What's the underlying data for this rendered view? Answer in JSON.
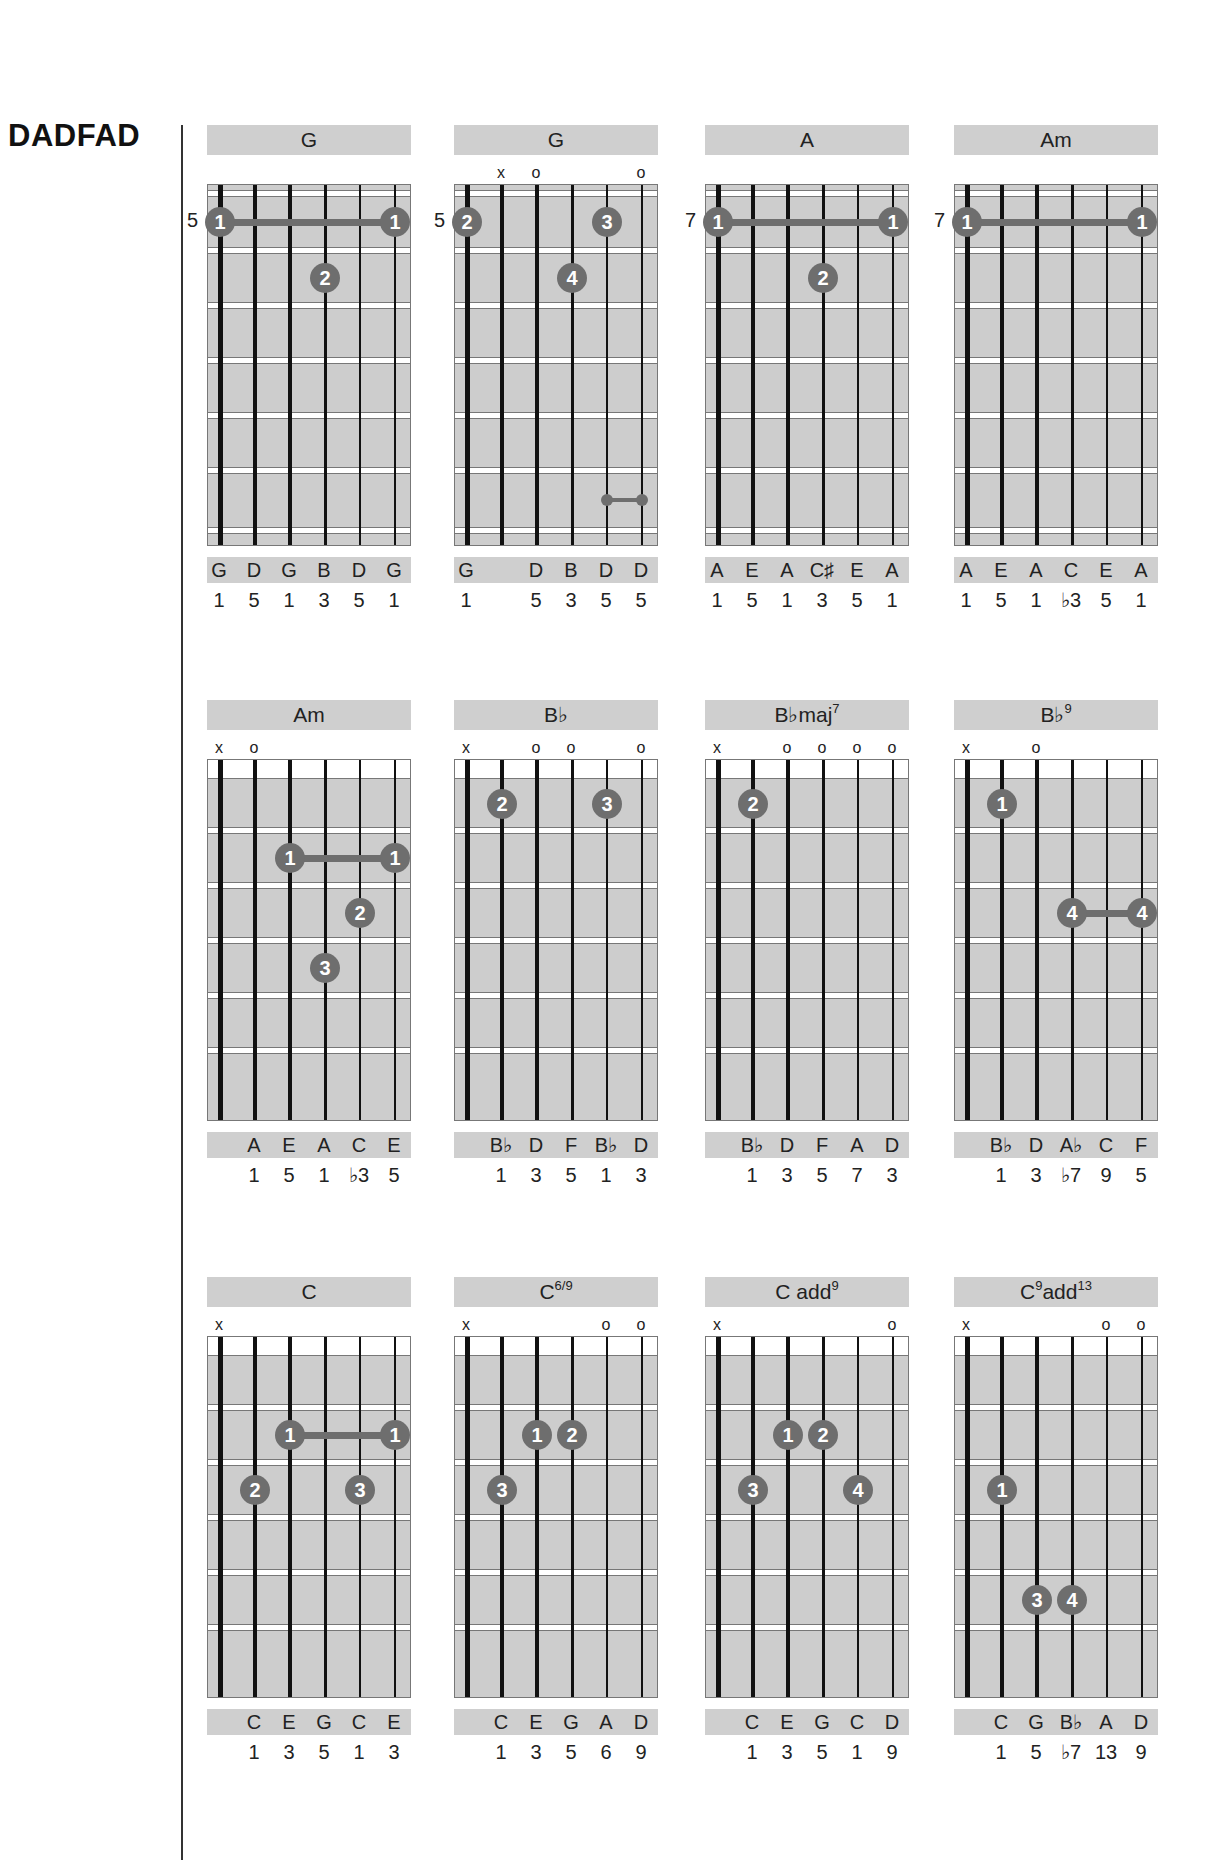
{
  "page": {
    "tuning_title": "DADFAD"
  },
  "chords": [
    {
      "name": "G",
      "sup": "",
      "start_fret_label": "5",
      "open_position": false,
      "markers": [
        "",
        "",
        "",
        "",
        "",
        ""
      ],
      "fingers": [
        {
          "string": 1,
          "fret": 1,
          "finger": "1"
        },
        {
          "string": 6,
          "fret": 1,
          "finger": "1"
        },
        {
          "string": 4,
          "fret": 2,
          "finger": "2"
        }
      ],
      "barres": [
        {
          "from": 1,
          "to": 6,
          "fret": 1
        }
      ],
      "small_dots": [],
      "notes": [
        "G",
        "D",
        "G",
        "B",
        "D",
        "G"
      ],
      "intervals": [
        "1",
        "5",
        "1",
        "3",
        "5",
        "1"
      ]
    },
    {
      "name": "G",
      "sup": "",
      "start_fret_label": "5",
      "open_position": false,
      "markers": [
        "",
        "x",
        "o",
        "",
        "",
        "o"
      ],
      "fingers": [
        {
          "string": 1,
          "fret": 1,
          "finger": "2"
        },
        {
          "string": 5,
          "fret": 1,
          "finger": "3"
        },
        {
          "string": 4,
          "fret": 2,
          "finger": "4"
        }
      ],
      "barres": [],
      "small_dots": [
        {
          "from": 5,
          "to": 6,
          "fret": 6
        }
      ],
      "notes": [
        "G",
        "",
        "D",
        "B",
        "D",
        "D"
      ],
      "intervals": [
        "1",
        "",
        "5",
        "3",
        "5",
        "5"
      ]
    },
    {
      "name": "A",
      "sup": "",
      "start_fret_label": "7",
      "open_position": false,
      "markers": [
        "",
        "",
        "",
        "",
        "",
        ""
      ],
      "fingers": [
        {
          "string": 1,
          "fret": 1,
          "finger": "1"
        },
        {
          "string": 6,
          "fret": 1,
          "finger": "1"
        },
        {
          "string": 4,
          "fret": 2,
          "finger": "2"
        }
      ],
      "barres": [
        {
          "from": 1,
          "to": 6,
          "fret": 1
        }
      ],
      "small_dots": [],
      "notes": [
        "A",
        "E",
        "A",
        "C♯",
        "E",
        "A"
      ],
      "intervals": [
        "1",
        "5",
        "1",
        "3",
        "5",
        "1"
      ]
    },
    {
      "name": "Am",
      "sup": "",
      "start_fret_label": "7",
      "open_position": false,
      "markers": [
        "",
        "",
        "",
        "",
        "",
        ""
      ],
      "fingers": [
        {
          "string": 1,
          "fret": 1,
          "finger": "1"
        },
        {
          "string": 6,
          "fret": 1,
          "finger": "1"
        }
      ],
      "barres": [
        {
          "from": 1,
          "to": 6,
          "fret": 1
        }
      ],
      "small_dots": [],
      "notes": [
        "A",
        "E",
        "A",
        "C",
        "E",
        "A"
      ],
      "intervals": [
        "1",
        "5",
        "1",
        "♭3",
        "5",
        "1"
      ]
    },
    {
      "name": "Am",
      "sup": "",
      "start_fret_label": "",
      "open_position": true,
      "markers": [
        "x",
        "o",
        "",
        "",
        "",
        ""
      ],
      "fingers": [
        {
          "string": 3,
          "fret": 2,
          "finger": "1"
        },
        {
          "string": 6,
          "fret": 2,
          "finger": "1"
        },
        {
          "string": 5,
          "fret": 3,
          "finger": "2"
        },
        {
          "string": 4,
          "fret": 4,
          "finger": "3"
        }
      ],
      "barres": [
        {
          "from": 3,
          "to": 6,
          "fret": 2
        }
      ],
      "small_dots": [],
      "notes": [
        "",
        "A",
        "E",
        "A",
        "C",
        "E"
      ],
      "intervals": [
        "",
        "1",
        "5",
        "1",
        "♭3",
        "5"
      ]
    },
    {
      "name": "B♭",
      "sup": "",
      "start_fret_label": "",
      "open_position": true,
      "markers": [
        "x",
        "",
        "o",
        "o",
        "",
        "o"
      ],
      "fingers": [
        {
          "string": 2,
          "fret": 1,
          "finger": "2"
        },
        {
          "string": 5,
          "fret": 1,
          "finger": "3"
        }
      ],
      "barres": [],
      "small_dots": [],
      "notes": [
        "",
        "B♭",
        "D",
        "F",
        "B♭",
        "D"
      ],
      "intervals": [
        "",
        "1",
        "3",
        "5",
        "1",
        "3"
      ]
    },
    {
      "name": "B♭maj",
      "sup": "7",
      "start_fret_label": "",
      "open_position": true,
      "markers": [
        "x",
        "",
        "o",
        "o",
        "o",
        "o"
      ],
      "fingers": [
        {
          "string": 2,
          "fret": 1,
          "finger": "2"
        }
      ],
      "barres": [],
      "small_dots": [],
      "notes": [
        "",
        "B♭",
        "D",
        "F",
        "A",
        "D"
      ],
      "intervals": [
        "",
        "1",
        "3",
        "5",
        "7",
        "3"
      ]
    },
    {
      "name": "B♭",
      "sup": "9",
      "start_fret_label": "",
      "open_position": true,
      "markers": [
        "x",
        "",
        "o",
        "",
        "",
        ""
      ],
      "fingers": [
        {
          "string": 2,
          "fret": 1,
          "finger": "1"
        },
        {
          "string": 4,
          "fret": 3,
          "finger": "4"
        },
        {
          "string": 6,
          "fret": 3,
          "finger": "4"
        }
      ],
      "barres": [
        {
          "from": 4,
          "to": 6,
          "fret": 3
        }
      ],
      "small_dots": [],
      "notes": [
        "",
        "B♭",
        "D",
        "A♭",
        "C",
        "F"
      ],
      "intervals": [
        "",
        "1",
        "3",
        "♭7",
        "9",
        "5"
      ]
    },
    {
      "name": "C",
      "sup": "",
      "start_fret_label": "",
      "open_position": true,
      "markers": [
        "x",
        "",
        "",
        "",
        "",
        ""
      ],
      "fingers": [
        {
          "string": 3,
          "fret": 2,
          "finger": "1"
        },
        {
          "string": 6,
          "fret": 2,
          "finger": "1"
        },
        {
          "string": 2,
          "fret": 3,
          "finger": "2"
        },
        {
          "string": 5,
          "fret": 3,
          "finger": "3"
        }
      ],
      "barres": [
        {
          "from": 3,
          "to": 6,
          "fret": 2
        }
      ],
      "small_dots": [],
      "notes": [
        "",
        "C",
        "E",
        "G",
        "C",
        "E"
      ],
      "intervals": [
        "",
        "1",
        "3",
        "5",
        "1",
        "3"
      ]
    },
    {
      "name": "C",
      "sup": "6/9",
      "start_fret_label": "",
      "open_position": true,
      "markers": [
        "x",
        "",
        "",
        "",
        "o",
        "o"
      ],
      "fingers": [
        {
          "string": 3,
          "fret": 2,
          "finger": "1"
        },
        {
          "string": 4,
          "fret": 2,
          "finger": "2"
        },
        {
          "string": 2,
          "fret": 3,
          "finger": "3"
        }
      ],
      "barres": [],
      "small_dots": [],
      "notes": [
        "",
        "C",
        "E",
        "G",
        "A",
        "D"
      ],
      "intervals": [
        "",
        "1",
        "3",
        "5",
        "6",
        "9"
      ]
    },
    {
      "name": "C add",
      "sup": "9",
      "start_fret_label": "",
      "open_position": true,
      "markers": [
        "x",
        "",
        "",
        "",
        "",
        "o"
      ],
      "fingers": [
        {
          "string": 3,
          "fret": 2,
          "finger": "1"
        },
        {
          "string": 4,
          "fret": 2,
          "finger": "2"
        },
        {
          "string": 2,
          "fret": 3,
          "finger": "3"
        },
        {
          "string": 5,
          "fret": 3,
          "finger": "4"
        }
      ],
      "barres": [],
      "small_dots": [],
      "notes": [
        "",
        "C",
        "E",
        "G",
        "C",
        "D"
      ],
      "intervals": [
        "",
        "1",
        "3",
        "5",
        "1",
        "9"
      ]
    },
    {
      "name": "C",
      "sup": "9",
      "suffix": "add",
      "suffix_sup": "13",
      "start_fret_label": "",
      "open_position": true,
      "markers": [
        "x",
        "",
        "",
        "",
        "o",
        "o"
      ],
      "fingers": [
        {
          "string": 2,
          "fret": 3,
          "finger": "1"
        },
        {
          "string": 3,
          "fret": 5,
          "finger": "3"
        },
        {
          "string": 4,
          "fret": 5,
          "finger": "4"
        }
      ],
      "barres": [],
      "small_dots": [],
      "notes": [
        "",
        "C",
        "G",
        "B♭",
        "A",
        "D"
      ],
      "intervals": [
        "",
        "1",
        "5",
        "♭7",
        "13",
        "9"
      ]
    }
  ],
  "layout": {
    "columns_x": [
      207,
      454,
      705,
      954
    ],
    "rows_y": [
      125,
      700,
      1277
    ]
  },
  "colors": {
    "board": "#cdcdcd",
    "dot": "#6e6e6e",
    "header_bar": "#cfcfcf"
  }
}
